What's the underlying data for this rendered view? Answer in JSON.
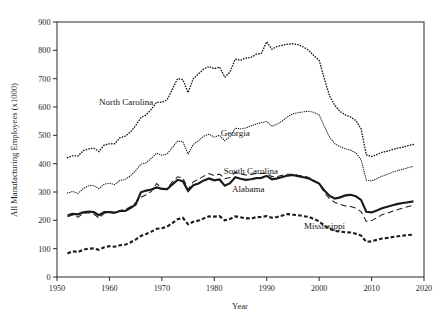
{
  "chart_data": {
    "type": "line",
    "title": "",
    "xlabel": "Year",
    "ylabel": "All Manufacturing Employees (x1000)",
    "xlim": [
      1950,
      2020
    ],
    "ylim": [
      0,
      900
    ],
    "xticks": [
      1950,
      1960,
      1970,
      1980,
      1990,
      2000,
      2010,
      2020
    ],
    "yticks": [
      0,
      100,
      200,
      300,
      400,
      500,
      600,
      700,
      800,
      900
    ],
    "grid": false,
    "legend_position": "inline-annotations",
    "annotations": [
      {
        "text": "North Carolina",
        "x": 1963.2,
        "y": 607
      },
      {
        "text": "Georgia",
        "x": 1984.0,
        "y": 497
      },
      {
        "text": "South Carolina",
        "x": 1987.0,
        "y": 363
      },
      {
        "text": "Alabama",
        "x": 1986.5,
        "y": 300
      },
      {
        "text": "Mississippi",
        "x": 2001.0,
        "y": 168
      }
    ],
    "x": [
      1952,
      1953,
      1954,
      1955,
      1956,
      1957,
      1958,
      1959,
      1960,
      1961,
      1962,
      1963,
      1964,
      1965,
      1966,
      1967,
      1968,
      1969,
      1970,
      1971,
      1972,
      1973,
      1974,
      1975,
      1976,
      1977,
      1978,
      1979,
      1980,
      1981,
      1982,
      1983,
      1984,
      1985,
      1986,
      1987,
      1988,
      1989,
      1990,
      1991,
      1992,
      1993,
      1994,
      1995,
      1996,
      1997,
      1998,
      1999,
      2000,
      2001,
      2002,
      2003,
      2004,
      2005,
      2006,
      2007,
      2008,
      2009,
      2010,
      2011,
      2012,
      2013,
      2014,
      2015,
      2016,
      2017,
      2018
    ],
    "series": [
      {
        "name": "North Carolina",
        "style": "dotted",
        "values": [
          421,
          428,
          427,
          446,
          452,
          455,
          443,
          466,
          470,
          470,
          491,
          497,
          512,
          534,
          563,
          572,
          592,
          617,
          617,
          625,
          663,
          700,
          697,
          651,
          700,
          717,
          734,
          743,
          735,
          741,
          705,
          724,
          769,
          765,
          773,
          775,
          786,
          790,
          830,
          804,
          814,
          818,
          822,
          823,
          820,
          812,
          800,
          781,
          765,
          699,
          639,
          605,
          584,
          572,
          565,
          552,
          523,
          431,
          425,
          432,
          440,
          444,
          450,
          455,
          458,
          464,
          468
        ]
      },
      {
        "name": "Georgia",
        "style": "dotted",
        "values": [
          296,
          302,
          295,
          312,
          322,
          323,
          312,
          328,
          331,
          326,
          341,
          344,
          357,
          375,
          398,
          403,
          419,
          437,
          430,
          434,
          457,
          480,
          478,
          434,
          468,
          482,
          497,
          504,
          494,
          500,
          481,
          495,
          525,
          523,
          526,
          533,
          540,
          545,
          549,
          532,
          540,
          551,
          566,
          576,
          580,
          583,
          585,
          581,
          572,
          532,
          493,
          470,
          460,
          452,
          448,
          438,
          414,
          342,
          339,
          347,
          356,
          362,
          370,
          376,
          380,
          386,
          391
        ]
      },
      {
        "name": "South Carolina",
        "style": "dashed",
        "values": [
          213,
          219,
          211,
          224,
          227,
          223,
          208,
          225,
          229,
          224,
          235,
          238,
          248,
          262,
          281,
          290,
          302,
          330,
          313,
          312,
          336,
          354,
          350,
          309,
          336,
          345,
          356,
          365,
          358,
          363,
          347,
          351,
          370,
          364,
          360,
          362,
          365,
          365,
          366,
          354,
          355,
          359,
          363,
          363,
          359,
          357,
          351,
          341,
          329,
          298,
          276,
          263,
          257,
          251,
          249,
          243,
          231,
          196,
          199,
          209,
          220,
          225,
          232,
          238,
          243,
          249,
          253
        ]
      },
      {
        "name": "Alabama",
        "style": "solid",
        "values": [
          218,
          223,
          221,
          228,
          231,
          229,
          218,
          229,
          229,
          227,
          233,
          233,
          243,
          256,
          299,
          305,
          309,
          316,
          311,
          310,
          327,
          343,
          338,
          304,
          324,
          330,
          341,
          348,
          341,
          344,
          322,
          331,
          352,
          347,
          343,
          345,
          349,
          350,
          357,
          345,
          348,
          353,
          358,
          360,
          356,
          352,
          348,
          339,
          330,
          305,
          286,
          277,
          281,
          288,
          290,
          285,
          272,
          230,
          228,
          235,
          243,
          248,
          253,
          258,
          261,
          264,
          267
        ]
      },
      {
        "name": "Mississippi",
        "style": "dashed-thick",
        "values": [
          83,
          91,
          88,
          96,
          100,
          101,
          96,
          105,
          109,
          107,
          112,
          114,
          122,
          132,
          145,
          152,
          160,
          170,
          172,
          178,
          190,
          204,
          209,
          186,
          195,
          199,
          207,
          214,
          213,
          215,
          200,
          205,
          214,
          211,
          207,
          207,
          211,
          212,
          215,
          209,
          212,
          217,
          222,
          220,
          218,
          215,
          212,
          205,
          196,
          181,
          170,
          163,
          160,
          158,
          157,
          153,
          146,
          124,
          126,
          131,
          136,
          138,
          141,
          144,
          146,
          148,
          150
        ]
      }
    ]
  }
}
